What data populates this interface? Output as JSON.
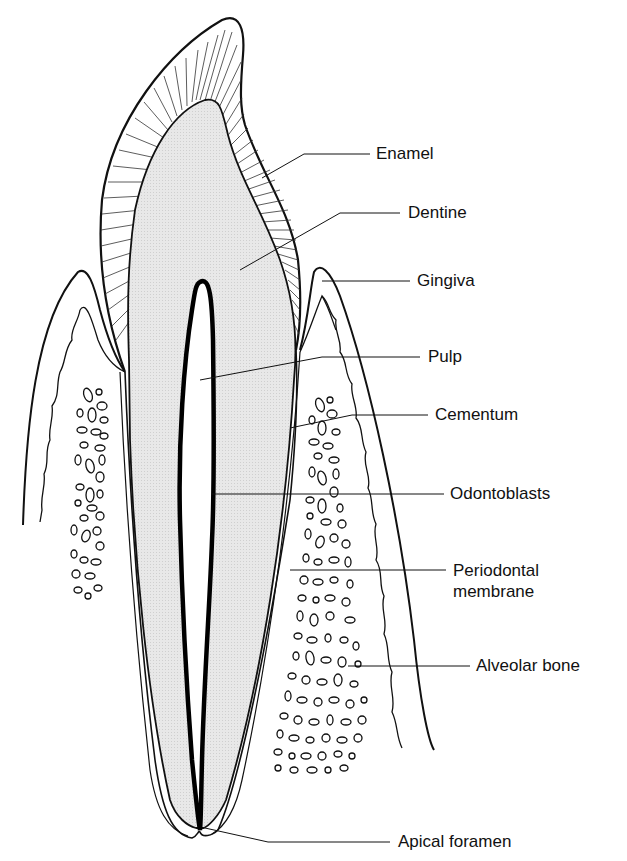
{
  "figure": {
    "labels": [
      {
        "id": "enamel",
        "text": "Enamel"
      },
      {
        "id": "dentine",
        "text": "Dentine"
      },
      {
        "id": "gingiva",
        "text": "Gingiva"
      },
      {
        "id": "pulp",
        "text": "Pulp"
      },
      {
        "id": "cementum",
        "text": "Cementum"
      },
      {
        "id": "odontoblasts",
        "text": "Odontoblasts"
      },
      {
        "id": "periodontal",
        "text": "Periodontal\nmembrane"
      },
      {
        "id": "alveolar",
        "text": "Alveolar bone"
      },
      {
        "id": "apical",
        "text": "Apical foramen"
      }
    ],
    "colors": {
      "outline": "#111111",
      "dentine_fill": "#e6e6e6",
      "background": "#ffffff"
    }
  }
}
